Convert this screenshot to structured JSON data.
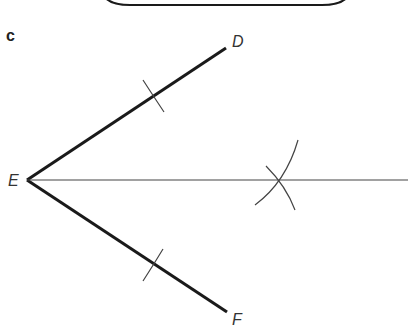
{
  "figure": {
    "part_label": "c",
    "points": {
      "D": {
        "label": "D",
        "x": 226,
        "y": 48
      },
      "E": {
        "label": "E",
        "x": 27,
        "y": 180
      },
      "F": {
        "label": "F",
        "x": 227,
        "y": 312
      }
    },
    "segments": [
      {
        "name": "ED",
        "from": "E",
        "to": "D",
        "weight": "thick"
      },
      {
        "name": "EF",
        "from": "E",
        "to": "F",
        "weight": "thick"
      },
      {
        "name": "bisector",
        "from": "E",
        "to_x": 408,
        "to_y": 180,
        "weight": "thin"
      }
    ],
    "arcs": [
      {
        "name": "arc-on-ED",
        "crosses": "ED"
      },
      {
        "name": "arc-on-EF",
        "crosses": "EF"
      },
      {
        "name": "arc-from-D-mark",
        "crosses": "bisector"
      },
      {
        "name": "arc-from-F-mark",
        "crosses": "bisector"
      }
    ],
    "colors": {
      "line": "#1a1a1a",
      "thin_line": "#444444"
    }
  }
}
